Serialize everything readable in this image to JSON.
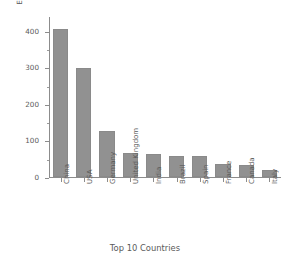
{
  "chart_data": {
    "type": "bar",
    "title": "",
    "xlabel": "Top 10 Countries",
    "ylabel": "Entectricity generation (TWh)",
    "categories": [
      "China",
      "USA",
      "Germany",
      "United Kingdom",
      "India",
      "Brazil",
      "Spain",
      "France",
      "Canada",
      "Italy"
    ],
    "values": [
      405,
      298,
      125,
      65,
      64,
      57,
      57,
      36,
      33,
      19
    ],
    "ylim": [
      0,
      440
    ],
    "yticks": [
      0,
      100,
      200,
      300,
      400
    ],
    "ytick_labels": [
      "0",
      "100",
      "200",
      "300",
      "400"
    ],
    "grid": false,
    "legend": false,
    "bar_color": "#919191",
    "axis_color": "#8c8c8c",
    "text_color": "#5a5a5a",
    "background": "#ffffff"
  }
}
